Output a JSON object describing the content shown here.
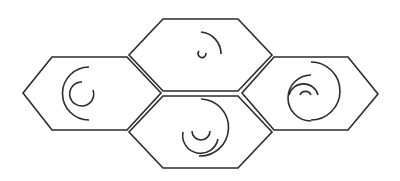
{
  "diagram": {
    "title": "",
    "description": "Four flat-topped hexagons (left, top, bottom, right) with nested circular arcs",
    "stroke_color": "#2b2b2b",
    "background_color": "#ffffff",
    "hexagons": [
      {
        "id": "left",
        "points": "52,57 127,57 161,93 127,130 52,130 23,93",
        "arcs": [
          "M 89 67 A 26 26 0 1 0 89 120",
          "M 82 82 A 12 12 0 1 0 93 90"
        ]
      },
      {
        "id": "top",
        "points": "163,19 238,19 272,55 238,91 163,91 129,55",
        "arcs": [
          "M 201 32 A 22 22 0 0 1 221 54",
          "M 199 51 A 4 4 0 1 0 206 53"
        ]
      },
      {
        "id": "bottom",
        "points": "163,96 238,96 272,132 238,168 163,168 129,132",
        "arcs": [
          "M 201 99 A 28 28 0 0 1 199 156",
          "M 183 132 A 17 17 0 0 0 218 139",
          "M 192 131 A 9 9 0 0 0 210 131"
        ]
      },
      {
        "id": "right",
        "points": "274,57 348,57 378,94 348,130 274,130 242,93",
        "arcs": [
          "M 311 62 A 28 28 0 0 1 311 120",
          "M 311 75 A 18 18 0 0 0 311 121",
          "M 289 95 A 15 15 0 0 1 318 95",
          "M 300 95 A 6 6 0 0 1 311 95"
        ]
      }
    ]
  }
}
